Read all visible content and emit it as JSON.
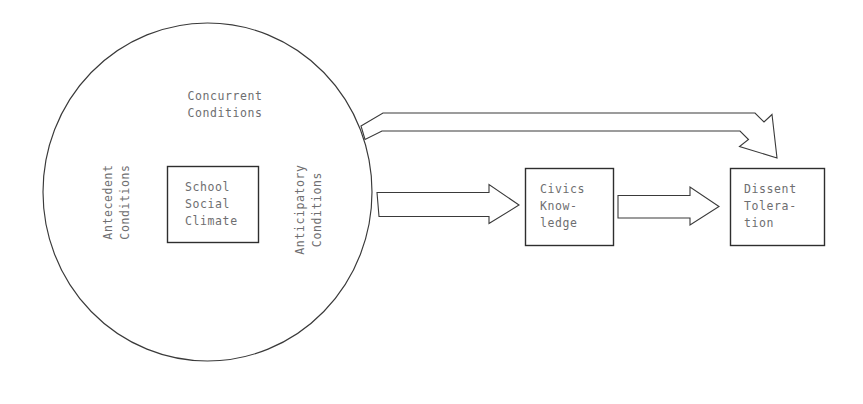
{
  "diagram": {
    "colors": {
      "stroke": "#3a3a3a",
      "box_stroke": "#2e2e2e",
      "text": "#6e6e70",
      "background": "#ffffff"
    },
    "circle": {
      "label_top": "Concurrent\nConditions",
      "label_left": "Antecedent\nConditions",
      "label_right": "Anticipatory\nConditions"
    },
    "nodes": [
      {
        "id": "school-social-climate",
        "label": "School\nSocial\nClimate",
        "shape": "rectangle"
      },
      {
        "id": "civics-knowledge",
        "label": "Civics\nKnow-\nledge",
        "shape": "rectangle"
      },
      {
        "id": "dissent-toleration",
        "label": "Dissent\nTolera-\ntion",
        "shape": "rectangle"
      }
    ],
    "connectors": [
      {
        "id": "climate-to-civics",
        "from": "school-social-climate",
        "to": "civics-knowledge",
        "style": "open-block-arrow",
        "direction": "right"
      },
      {
        "id": "civics-to-dissent",
        "from": "civics-knowledge",
        "to": "dissent-toleration",
        "style": "open-block-arrow",
        "direction": "right"
      },
      {
        "id": "climate-to-dissent-direct",
        "from": "school-social-climate",
        "to": "dissent-toleration",
        "style": "open-block-arrow-bent",
        "direction": "down-right"
      }
    ]
  }
}
